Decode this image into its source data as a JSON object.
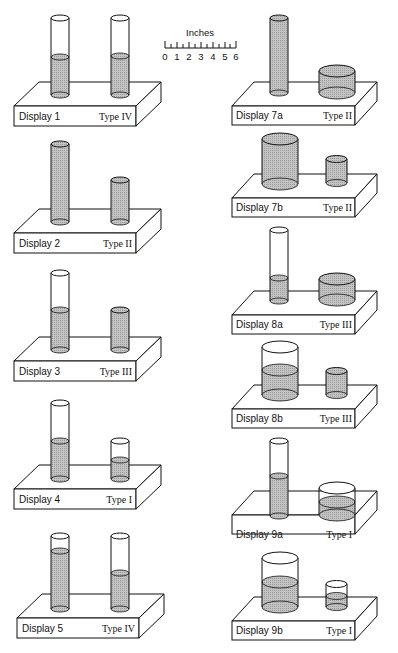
{
  "scale": {
    "title": "Inches",
    "ticks": [
      "0",
      "1",
      "2",
      "3",
      "4",
      "5",
      "6"
    ]
  },
  "colors": {
    "ink": "#111111",
    "fill": "#bdbdbd",
    "background": "#ffffff"
  },
  "displays": [
    {
      "id": "d1",
      "label": "Display 1",
      "type": "Type IV"
    },
    {
      "id": "d2",
      "label": "Display 2",
      "type": "Type II"
    },
    {
      "id": "d3",
      "label": "Display 3",
      "type": "Type III"
    },
    {
      "id": "d4",
      "label": "Display 4",
      "type": "Type I"
    },
    {
      "id": "d5",
      "label": "Display 5",
      "type": "Type IV"
    },
    {
      "id": "d7a",
      "label": "Display 7a",
      "type": "Type II"
    },
    {
      "id": "d7b",
      "label": "Display 7b",
      "type": "Type II"
    },
    {
      "id": "d8a",
      "label": "Display 8a",
      "type": "Type III"
    },
    {
      "id": "d8b",
      "label": "Display 8b",
      "type": "Type III"
    },
    {
      "id": "d9a",
      "label": "Display 9a",
      "type": "Type I"
    },
    {
      "id": "d9b",
      "label": "Display 9b",
      "type": "Type I"
    }
  ]
}
